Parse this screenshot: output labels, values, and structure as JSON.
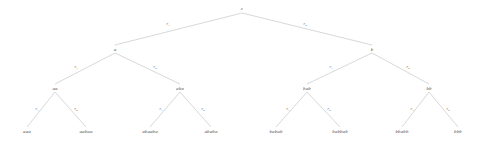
{
  "figure": {
    "type": "derivation-tree",
    "background_color": "#ffffff",
    "edge_color": "#b8b8b8",
    "node_text_color": "#4a4a4a",
    "edge_text_color": "#5a5a5a"
  },
  "nodes": [
    {
      "id": "root",
      "label": "ε",
      "x": 242,
      "y": 9,
      "level": 0,
      "kind": "root"
    },
    {
      "id": "a",
      "label": "a",
      "x": 115,
      "y": 49,
      "level": 1,
      "kind": "internal"
    },
    {
      "id": "b",
      "label": "b",
      "x": 372,
      "y": 49,
      "level": 1,
      "kind": "internal"
    },
    {
      "id": "aa",
      "label": "aa",
      "x": 55,
      "y": 88,
      "level": 2,
      "kind": "internal"
    },
    {
      "id": "aba",
      "label": "aba",
      "x": 180,
      "y": 88,
      "level": 2,
      "kind": "internal"
    },
    {
      "id": "bab",
      "label": "bab",
      "x": 307,
      "y": 88,
      "level": 2,
      "kind": "internal"
    },
    {
      "id": "bb",
      "label": "bb",
      "x": 429,
      "y": 88,
      "level": 2,
      "kind": "internal"
    },
    {
      "id": "aaa",
      "label": "aaa",
      "x": 27,
      "y": 131,
      "level": 3,
      "kind": "leaf"
    },
    {
      "id": "aabaa",
      "label": "aabaa",
      "x": 86,
      "y": 131,
      "level": 3,
      "kind": "leaf"
    },
    {
      "id": "abaaba",
      "label": "abaaba",
      "x": 150,
      "y": 131,
      "level": 3,
      "kind": "leaf"
    },
    {
      "id": "ababa",
      "label": "ababa",
      "x": 211,
      "y": 131,
      "level": 3,
      "kind": "leaf"
    },
    {
      "id": "babab",
      "label": "babab",
      "x": 276,
      "y": 131,
      "level": 3,
      "kind": "leaf"
    },
    {
      "id": "babbab",
      "label": "babbab",
      "x": 340,
      "y": 131,
      "level": 3,
      "kind": "leaf"
    },
    {
      "id": "bbabb",
      "label": "bbabb",
      "x": 402,
      "y": 131,
      "level": 3,
      "kind": "leaf"
    },
    {
      "id": "bbb",
      "label": "bbb",
      "x": 458,
      "y": 131,
      "level": 3,
      "kind": "leaf"
    }
  ],
  "edges": [
    {
      "from": "root",
      "to": "a",
      "label_base": "r",
      "label_sub": "1",
      "lx": 168,
      "ly": 24
    },
    {
      "from": "root",
      "to": "b",
      "label_base": "r",
      "label_sub": "2",
      "lx": 305,
      "ly": 24
    },
    {
      "from": "a",
      "to": "aa",
      "label_base": "r",
      "label_sub": "1",
      "lx": 76,
      "ly": 67
    },
    {
      "from": "a",
      "to": "aba",
      "label_base": "r",
      "label_sub": "2",
      "lx": 155,
      "ly": 67
    },
    {
      "from": "b",
      "to": "bab",
      "label_base": "r",
      "label_sub": "1",
      "lx": 331,
      "ly": 67
    },
    {
      "from": "b",
      "to": "bb",
      "label_base": "r",
      "label_sub": "2",
      "lx": 408,
      "ly": 67
    },
    {
      "from": "aa",
      "to": "aaa",
      "label_base": "r",
      "label_sub": "1",
      "lx": 37,
      "ly": 109
    },
    {
      "from": "aa",
      "to": "aabaa",
      "label_base": "r",
      "label_sub": "2",
      "lx": 76,
      "ly": 109
    },
    {
      "from": "aba",
      "to": "abaaba",
      "label_base": "r",
      "label_sub": "1",
      "lx": 161,
      "ly": 109
    },
    {
      "from": "aba",
      "to": "ababa",
      "label_base": "r",
      "label_sub": "2",
      "lx": 203,
      "ly": 109
    },
    {
      "from": "bab",
      "to": "babab",
      "label_base": "r",
      "label_sub": "1",
      "lx": 288,
      "ly": 109
    },
    {
      "from": "bab",
      "to": "babbab",
      "label_base": "r",
      "label_sub": "2",
      "lx": 329,
      "ly": 109
    },
    {
      "from": "bb",
      "to": "bbabb",
      "label_base": "r",
      "label_sub": "1",
      "lx": 412,
      "ly": 109
    },
    {
      "from": "bb",
      "to": "bbb",
      "label_base": "r",
      "label_sub": "2",
      "lx": 448,
      "ly": 109
    }
  ]
}
